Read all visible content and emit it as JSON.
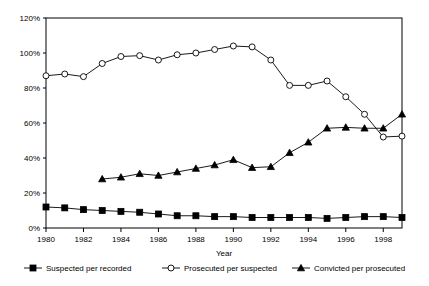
{
  "chart_data": {
    "type": "line",
    "title": "",
    "xlabel": "Year",
    "ylabel": "",
    "ylim": [
      0,
      120
    ],
    "xlim": [
      1980,
      1999
    ],
    "grid": false,
    "legend_position": "bottom",
    "ytick_labels": [
      "0%",
      "20%",
      "40%",
      "60%",
      "80%",
      "100%",
      "120%"
    ],
    "ytick_values": [
      0,
      20,
      40,
      60,
      80,
      100,
      120
    ],
    "xtick_labels": [
      "1980",
      "1982",
      "1984",
      "1986",
      "1988",
      "1990",
      "1992",
      "1994",
      "1996",
      "1998"
    ],
    "xtick_values": [
      1980,
      1982,
      1984,
      1986,
      1988,
      1990,
      1992,
      1994,
      1996,
      1998
    ],
    "x": [
      1980,
      1981,
      1982,
      1983,
      1984,
      1985,
      1986,
      1987,
      1988,
      1989,
      1990,
      1991,
      1992,
      1993,
      1994,
      1995,
      1996,
      1997,
      1998,
      1999
    ],
    "series": [
      {
        "name": "Suspected per recorded",
        "marker": "filled-square",
        "x": [
          1980,
          1981,
          1982,
          1983,
          1984,
          1985,
          1986,
          1987,
          1988,
          1989,
          1990,
          1991,
          1992,
          1993,
          1994,
          1995,
          1996,
          1997,
          1998,
          1999
        ],
        "values": [
          12,
          11.5,
          10.5,
          10,
          9.5,
          9,
          8,
          7,
          7,
          6.5,
          6.5,
          6,
          6,
          6,
          6,
          5.5,
          6,
          6.5,
          6.5,
          6
        ]
      },
      {
        "name": "Prosecuted per suspected",
        "marker": "open-circle",
        "x": [
          1980,
          1981,
          1982,
          1983,
          1984,
          1985,
          1986,
          1987,
          1988,
          1989,
          1990,
          1991,
          1992,
          1993,
          1994,
          1995,
          1996,
          1997,
          1998,
          1999
        ],
        "values": [
          87,
          88,
          86.5,
          94,
          98,
          98.5,
          96,
          99,
          100,
          102,
          104,
          103.5,
          96,
          81.5,
          81.5,
          84,
          75,
          65,
          52,
          52.5
        ]
      },
      {
        "name": "Convicted per prosecuted",
        "marker": "filled-triangle",
        "x": [
          1983,
          1984,
          1985,
          1986,
          1987,
          1988,
          1989,
          1990,
          1991,
          1992,
          1993,
          1994,
          1995,
          1996,
          1997,
          1998,
          1999
        ],
        "values": [
          28,
          29,
          31,
          30,
          32,
          34,
          36,
          39,
          34.5,
          35,
          43,
          49,
          57,
          57.5,
          57,
          57,
          65
        ]
      }
    ]
  },
  "legend": {
    "items": [
      {
        "label": "Suspected per recorded",
        "marker": "filled-square"
      },
      {
        "label": "Prosecuted per suspected",
        "marker": "open-circle"
      },
      {
        "label": "Convicted per prosecuted",
        "marker": "filled-triangle"
      }
    ]
  },
  "axis": {
    "x_title": "Year"
  }
}
